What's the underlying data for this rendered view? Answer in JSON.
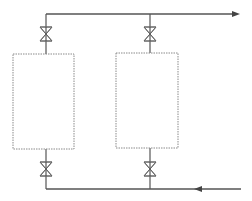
{
  "diagram": {
    "title": "",
    "type": "process-piping",
    "colors": {
      "line": "#555555",
      "vessel": "#8a8a8a",
      "background": "#ffffff"
    },
    "vessels": [
      {
        "id": "vessel-1",
        "x": 13,
        "y": 54,
        "w": 61,
        "h": 95
      },
      {
        "id": "vessel-2",
        "x": 116,
        "y": 53,
        "w": 62,
        "h": 95
      }
    ],
    "valves": [
      {
        "id": "valve-top-1",
        "cx": 46,
        "cy": 34
      },
      {
        "id": "valve-top-2",
        "cx": 150,
        "cy": 34
      },
      {
        "id": "valve-bottom-1",
        "cx": 46,
        "cy": 169
      },
      {
        "id": "valve-bottom-2",
        "cx": 150,
        "cy": 169
      }
    ],
    "pipes": {
      "outlet_header": {
        "y": 14,
        "x1": 46,
        "x2": 240,
        "flow": "right"
      },
      "inlet_header": {
        "y": 189,
        "x1": 46,
        "x2": 241,
        "flow": "left"
      }
    }
  }
}
